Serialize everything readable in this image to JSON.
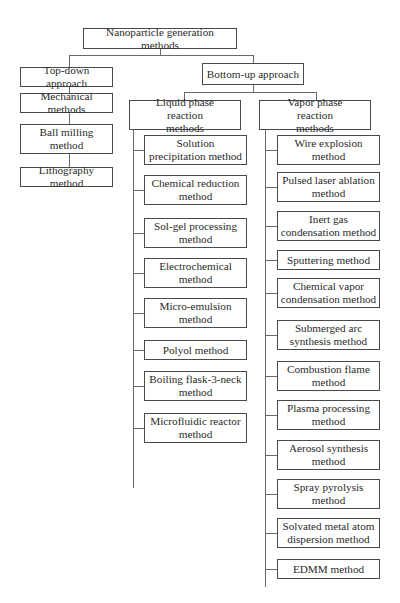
{
  "root": {
    "label": "Nanoparticle generation methods"
  },
  "top_down": {
    "label": "Top-down approach",
    "children": [
      {
        "label": "Mechanical methods"
      },
      {
        "label": "Ball milling method"
      },
      {
        "label": "Lithography method"
      }
    ]
  },
  "bottom_up": {
    "label": "Bottom-up approach",
    "liquid": {
      "label": "Liquid phase reaction methods",
      "children": [
        {
          "label": "Solution precipitation method"
        },
        {
          "label": "Chemical reduction method"
        },
        {
          "label": "Sol-gel processing method"
        },
        {
          "label": "Electrochemical method"
        },
        {
          "label": "Micro-emulsion method"
        },
        {
          "label": "Polyol method"
        },
        {
          "label": "Boiling flask-3-neck method"
        },
        {
          "label": "Microfluidic reactor method"
        }
      ]
    },
    "vapor": {
      "label": "Vapor phase reaction methods",
      "children": [
        {
          "label": "Wire explosion method"
        },
        {
          "label": "Pulsed laser ablation method"
        },
        {
          "label": "Inert gas condensation method"
        },
        {
          "label": "Sputtering method"
        },
        {
          "label": "Chemical vapor condensation method"
        },
        {
          "label": "Submerged arc synthesis method"
        },
        {
          "label": "Combustion flame method"
        },
        {
          "label": "Plasma processing method"
        },
        {
          "label": "Aerosol synthesis method"
        },
        {
          "label": "Spray pyrolysis method"
        },
        {
          "label": "Solvated metal atom dispersion method"
        },
        {
          "label": "EDMM method"
        }
      ]
    }
  }
}
